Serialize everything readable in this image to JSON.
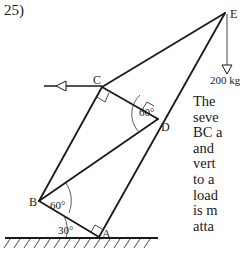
{
  "problem": {
    "number": "25)"
  },
  "diagram": {
    "points": {
      "A": {
        "label": "A"
      },
      "B": {
        "label": "B"
      },
      "C": {
        "label": "C"
      },
      "D": {
        "label": "D"
      },
      "E": {
        "label": "E"
      }
    },
    "angles": {
      "B_upper": "60°",
      "B_lower": "30°",
      "D": "60°"
    },
    "load": "200 kg"
  },
  "description": {
    "lines": [
      "The",
      "seve",
      "BC a",
      "and",
      "vert",
      "to a",
      "load",
      "is m",
      "atta"
    ]
  }
}
